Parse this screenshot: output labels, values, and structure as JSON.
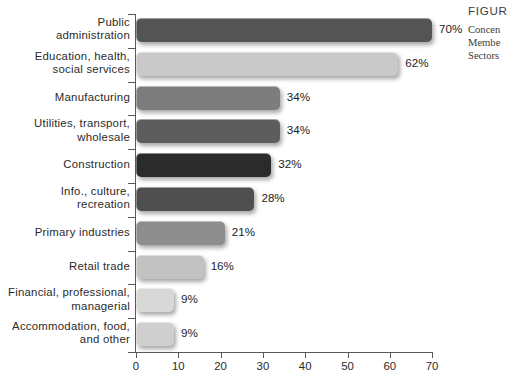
{
  "figure": {
    "caption_title": "FIGUR",
    "caption_lines": [
      "Concen",
      "Membe",
      "Sectors"
    ]
  },
  "chart_data": {
    "type": "bar",
    "orientation": "horizontal",
    "title": "",
    "xlabel": "",
    "ylabel": "",
    "xlim": [
      0,
      70
    ],
    "xticks": [
      0,
      10,
      20,
      30,
      40,
      50,
      60,
      70
    ],
    "xtick_labels": [
      "0",
      "10",
      "20",
      "30",
      "40",
      "50",
      "60",
      "70"
    ],
    "grid": false,
    "legend": "none",
    "value_suffix": "%",
    "categories": [
      "Public\nadministration",
      "Education, health,\nsocial services",
      "Manufacturing",
      "Utilities, transport,\nwholesale",
      "Construction",
      "Info., culture,\nrecreation",
      "Primary industries",
      "Retail trade",
      "Financial, professional,\nmanagerial",
      "Accommodation, food,\nand other"
    ],
    "values": [
      70,
      62,
      34,
      34,
      32,
      28,
      21,
      16,
      9,
      9
    ],
    "value_labels": [
      "70%",
      "62%",
      "34%",
      "34%",
      "32%",
      "28%",
      "21%",
      "16%",
      "9%",
      "9%"
    ],
    "bar_colors": [
      "#545454",
      "#c9c9c9",
      "#7d7d7d",
      "#5d5d5d",
      "#2b2b2b",
      "#4f4f4f",
      "#8d8d8d",
      "#c2c2c2",
      "#d8d8d8",
      "#cfcfcf"
    ]
  }
}
